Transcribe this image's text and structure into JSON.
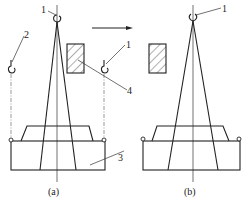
{
  "diagram": {
    "panels": [
      {
        "id": "a",
        "caption": "(a)"
      },
      {
        "id": "b",
        "caption": "(b)"
      }
    ],
    "labels": {
      "hook_main_a": "1",
      "hook_aux_left": "2",
      "hook_right_a": "1",
      "base": "3",
      "obstacle": "4",
      "hook_main_b": "1"
    },
    "arrow_direction": "right",
    "colors": {
      "line": "#222222",
      "background": "#ffffff"
    }
  }
}
